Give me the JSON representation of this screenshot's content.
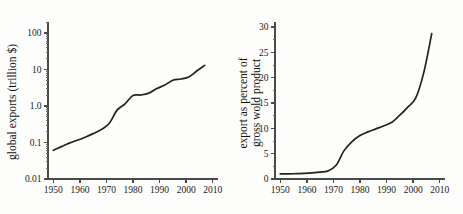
{
  "figure": {
    "background_color": "#fdfdfb",
    "line_color": "#25211f",
    "axis_color": "#4a4a4a"
  },
  "chart_data": [
    {
      "id": "global-exports",
      "type": "line",
      "title": "",
      "xlabel": "",
      "ylabel": "global exports (trillion $)",
      "yscale": "log",
      "xlim": [
        1948,
        2012
      ],
      "ylim": [
        0.01,
        200
      ],
      "grid": false,
      "legend": null,
      "xticks": [
        1950,
        1960,
        1970,
        1980,
        1990,
        2000,
        2010
      ],
      "xtick_labels": [
        "1950",
        "1960",
        "1970",
        "1980",
        "1990",
        "2000",
        "2010"
      ],
      "yticks": [
        0.01,
        0.1,
        1.0,
        10,
        100
      ],
      "ytick_labels": [
        "0.01",
        "0.1",
        "1.0",
        "10",
        "100"
      ],
      "x": [
        1950,
        1953,
        1956,
        1959,
        1962,
        1965,
        1968,
        1971,
        1974,
        1977,
        1980,
        1983,
        1986,
        1989,
        1992,
        1995,
        1998,
        2001,
        2004,
        2007
      ],
      "values": [
        0.061,
        0.077,
        0.096,
        0.115,
        0.14,
        0.175,
        0.225,
        0.33,
        0.77,
        1.15,
        1.95,
        2.0,
        2.25,
        3.0,
        3.75,
        5.1,
        5.5,
        6.2,
        9.1,
        13.0
      ],
      "series": [
        {
          "name": "global exports",
          "unit": "trillion $",
          "values": [
            0.061,
            0.077,
            0.096,
            0.115,
            0.14,
            0.175,
            0.225,
            0.33,
            0.77,
            1.15,
            1.95,
            2.0,
            2.25,
            3.0,
            3.75,
            5.1,
            5.5,
            6.2,
            9.1,
            13.0
          ]
        }
      ]
    },
    {
      "id": "exports-percent-gwp",
      "type": "line",
      "title": "",
      "xlabel": "",
      "ylabel": "export as percent of gross wold product",
      "yscale": "linear",
      "xlim": [
        1948,
        2012
      ],
      "ylim": [
        0,
        31
      ],
      "grid": false,
      "legend": null,
      "xticks": [
        1950,
        1960,
        1970,
        1980,
        1990,
        2000,
        2010
      ],
      "xtick_labels": [
        "1950",
        "1960",
        "1970",
        "1980",
        "1990",
        "2000",
        "2010"
      ],
      "yticks": [
        0,
        5,
        10,
        15,
        20,
        25,
        30
      ],
      "ytick_labels": [
        "0",
        "5",
        "10",
        "15",
        "20",
        "25",
        "30"
      ],
      "x": [
        1950,
        1953,
        1956,
        1959,
        1962,
        1965,
        1968,
        1971,
        1974,
        1977,
        1980,
        1983,
        1986,
        1989,
        1992,
        1995,
        1998,
        2001,
        2004,
        2007
      ],
      "values": [
        1.0,
        1.0,
        1.05,
        1.1,
        1.2,
        1.35,
        1.6,
        2.7,
        5.6,
        7.4,
        8.6,
        9.3,
        9.9,
        10.5,
        11.2,
        12.6,
        14.2,
        16.0,
        21.0,
        28.7
      ],
      "series": [
        {
          "name": "exports as percent of gross world product",
          "unit": "percent",
          "values": [
            1.0,
            1.0,
            1.05,
            1.1,
            1.2,
            1.35,
            1.6,
            2.7,
            5.6,
            7.4,
            8.6,
            9.3,
            9.9,
            10.5,
            11.2,
            12.6,
            14.2,
            16.0,
            21.0,
            28.7
          ]
        }
      ]
    }
  ]
}
